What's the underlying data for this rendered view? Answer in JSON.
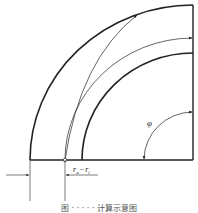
{
  "diagram": {
    "angle_label": "φ",
    "dimension_label": {
      "r1": "r",
      "r1_sub": "a",
      "minus": "−",
      "r2": "r",
      "r2_sub": "i"
    },
    "caption": "图 · · · · · 计算示意图",
    "colors": {
      "line": "#222222",
      "background": "#ffffff"
    }
  }
}
